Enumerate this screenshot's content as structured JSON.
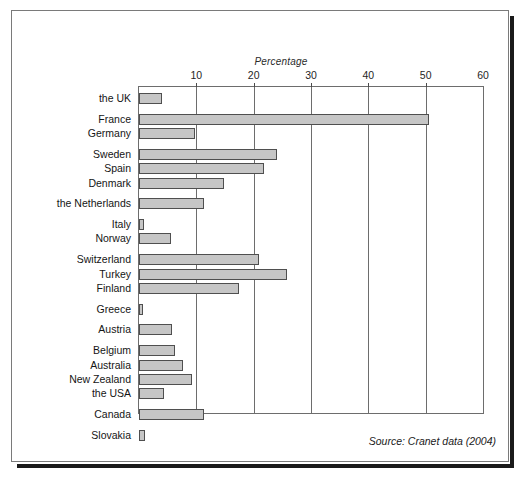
{
  "top_sliver_text": "",
  "source_note": "Source: Cranet data (2004)",
  "chart_data": {
    "type": "bar",
    "orientation": "horizontal",
    "title": "",
    "xlabel": "Percentage",
    "ylabel": "",
    "xlim": [
      0,
      60
    ],
    "xticks": [
      10,
      20,
      30,
      40,
      50,
      60
    ],
    "grid": true,
    "legend": null,
    "bar_color": "#c6c6c6",
    "bar_border_color": "#4f4f4f",
    "categories": [
      "the UK",
      "France",
      "Germany",
      "Sweden",
      "Spain",
      "Denmark",
      "the Netherlands",
      "Italy",
      "Norway",
      "Switzerland",
      "Turkey",
      "Finland",
      "Greece",
      "Austria",
      "Belgium",
      "Australia",
      "New Zealand",
      "the USA",
      "Canada",
      "Slovakia"
    ],
    "values": [
      4.0,
      50.5,
      9.8,
      24.0,
      21.8,
      14.8,
      11.3,
      0.8,
      5.5,
      21.0,
      25.8,
      17.5,
      0.7,
      5.7,
      6.3,
      7.6,
      9.3,
      4.3,
      11.4,
      1.0
    ]
  }
}
